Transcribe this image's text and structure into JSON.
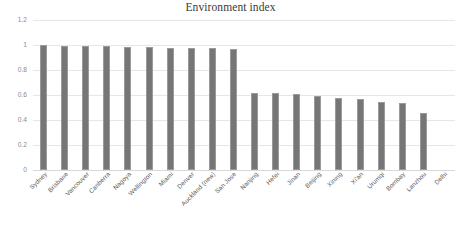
{
  "chart_data": {
    "type": "bar",
    "title": "Environment index",
    "xlabel": "",
    "ylabel": "",
    "ylim": [
      0,
      1.2
    ],
    "yticks": [
      "0",
      "0.2",
      "0.4",
      "0.6",
      "0.8",
      "1",
      "1.2"
    ],
    "ytick_values": [
      0,
      0.2,
      0.4,
      0.6,
      0.8,
      1,
      1.2
    ],
    "grid": true,
    "legend": false,
    "bar_color": "#767676",
    "gridline_color": "#e6e6e6",
    "categories": [
      "Sydney",
      "Brisbane",
      "Vancouver",
      "Canberra",
      "Nagoya",
      "Wellington",
      "Miami",
      "Denver",
      "Auckland (new)",
      "San Jose",
      "Nanjing",
      "Hefei",
      "Jinan",
      "Beijing",
      "Xining",
      "Xi'an",
      "Urumqi",
      "Bombay",
      "Lanzhou",
      "Delhi"
    ],
    "values": [
      1.0,
      0.995,
      0.99,
      0.99,
      0.985,
      0.985,
      0.98,
      0.98,
      0.975,
      0.97,
      0.62,
      0.615,
      0.605,
      0.595,
      0.58,
      0.57,
      0.545,
      0.535,
      0.46,
      0.0
    ]
  }
}
